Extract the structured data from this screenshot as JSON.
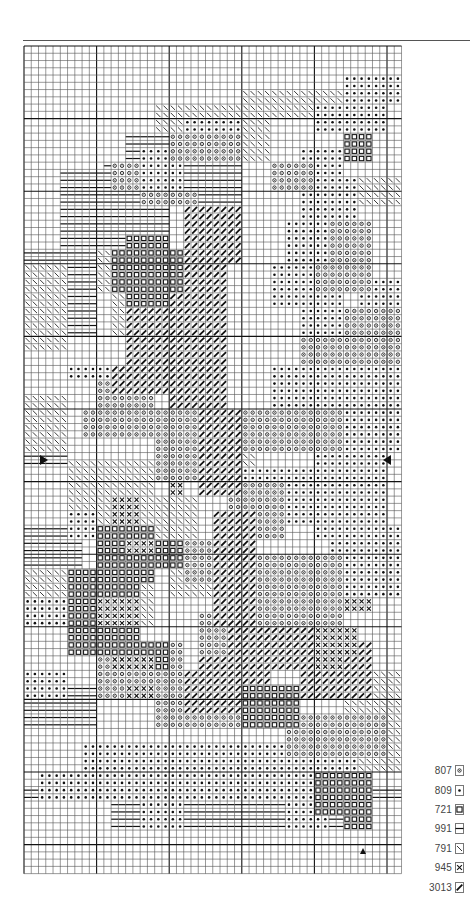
{
  "chart_data": {
    "type": "cross-stitch-pattern",
    "title": "",
    "grid": {
      "columns": 52,
      "rows": 114,
      "cell_px": 7.26,
      "origin_px": [
        24,
        46
      ],
      "bold_line_every": 10,
      "line_color": "#222222",
      "center_markers": {
        "row_arrows": {
          "row": 57,
          "left": "right-pointing-triangle",
          "right": "left-pointing-triangle"
        },
        "column_arrow": {
          "column": 49,
          "position": "bottom",
          "glyph": "up-pointing-triangle"
        }
      }
    },
    "legend": [
      {
        "code": "807",
        "symbol": "circle-dot",
        "glyph": "o"
      },
      {
        "code": "809",
        "symbol": "filled-dot",
        "glyph": "•"
      },
      {
        "code": "721",
        "symbol": "square",
        "glyph": "□"
      },
      {
        "code": "991",
        "symbol": "horizontal-lines",
        "glyph": "═"
      },
      {
        "code": "791",
        "symbol": "backslash",
        "glyph": "\\"
      },
      {
        "code": "945",
        "symbol": "x-cross",
        "glyph": "×"
      },
      {
        "code": "3013",
        "symbol": "bold-slash",
        "glyph": "/"
      }
    ],
    "regions": [
      {
        "symbol": "991",
        "rects": [
          [
            14,
            12,
            34,
            16
          ],
          [
            11,
            16,
            30,
            22
          ],
          [
            5,
            22,
            20,
            28
          ],
          [
            5,
            17,
            14,
            22
          ],
          [
            0,
            28,
            10,
            40
          ],
          [
            0,
            52,
            6,
            58
          ],
          [
            13,
            30,
            20,
            40
          ],
          [
            0,
            66,
            8,
            80
          ],
          [
            0,
            88,
            10,
            94
          ],
          [
            0,
            102,
            52,
            104
          ],
          [
            12,
            104,
            48,
            108
          ]
        ]
      },
      {
        "symbol": "791",
        "rects": [
          [
            0,
            30,
            6,
            42
          ],
          [
            10,
            28,
            18,
            34
          ],
          [
            12,
            34,
            18,
            40
          ],
          [
            0,
            48,
            6,
            56
          ],
          [
            6,
            57,
            22,
            60
          ],
          [
            8,
            60,
            18,
            66
          ],
          [
            6,
            60,
            10,
            66
          ],
          [
            0,
            72,
            6,
            76
          ],
          [
            16,
            62,
            24,
            70
          ],
          [
            20,
            70,
            28,
            76
          ],
          [
            14,
            68,
            18,
            80
          ],
          [
            26,
            50,
            32,
            60
          ],
          [
            18,
            8,
            34,
            12
          ],
          [
            24,
            12,
            34,
            16
          ],
          [
            30,
            6,
            48,
            10
          ],
          [
            46,
            18,
            52,
            22
          ],
          [
            44,
            86,
            52,
            100
          ],
          [
            10,
            66,
            14,
            72
          ]
        ]
      },
      {
        "symbol": "809",
        "rects": [
          [
            44,
            4,
            52,
            8
          ],
          [
            40,
            8,
            50,
            12
          ],
          [
            22,
            10,
            30,
            14
          ],
          [
            16,
            14,
            22,
            20
          ],
          [
            38,
            14,
            44,
            18
          ],
          [
            38,
            18,
            46,
            24
          ],
          [
            36,
            24,
            44,
            30
          ],
          [
            34,
            30,
            44,
            36
          ],
          [
            38,
            36,
            52,
            42
          ],
          [
            34,
            44,
            52,
            50
          ],
          [
            32,
            50,
            52,
            56
          ],
          [
            40,
            56,
            50,
            68
          ],
          [
            28,
            58,
            40,
            66
          ],
          [
            42,
            66,
            52,
            76
          ],
          [
            6,
            64,
            10,
            68
          ],
          [
            0,
            76,
            10,
            80
          ],
          [
            0,
            86,
            6,
            90
          ],
          [
            36,
            70,
            44,
            76
          ],
          [
            30,
            78,
            40,
            82
          ],
          [
            8,
            96,
            46,
            100
          ],
          [
            2,
            100,
            40,
            104
          ],
          [
            16,
            104,
            22,
            108
          ],
          [
            36,
            104,
            42,
            108
          ],
          [
            46,
            32,
            52,
            42
          ],
          [
            6,
            44,
            18,
            46
          ]
        ]
      },
      {
        "symbol": "807",
        "rects": [
          [
            20,
            12,
            30,
            16
          ],
          [
            12,
            16,
            16,
            20
          ],
          [
            16,
            20,
            24,
            22
          ],
          [
            34,
            16,
            40,
            20
          ],
          [
            40,
            30,
            48,
            34
          ],
          [
            44,
            36,
            52,
            40
          ],
          [
            38,
            40,
            52,
            44
          ],
          [
            10,
            46,
            18,
            50
          ],
          [
            8,
            50,
            26,
            54
          ],
          [
            18,
            54,
            24,
            60
          ],
          [
            28,
            60,
            36,
            68
          ],
          [
            22,
            68,
            30,
            74
          ],
          [
            30,
            70,
            44,
            80
          ],
          [
            10,
            82,
            22,
            90
          ],
          [
            18,
            88,
            34,
            94
          ],
          [
            24,
            78,
            30,
            84
          ],
          [
            36,
            92,
            50,
            98
          ],
          [
            30,
            50,
            44,
            56
          ],
          [
            42,
            24,
            48,
            30
          ]
        ]
      },
      {
        "symbol": "3013",
        "rects": [
          [
            22,
            22,
            30,
            30
          ],
          [
            20,
            30,
            28,
            50
          ],
          [
            24,
            50,
            30,
            62
          ],
          [
            26,
            64,
            32,
            80
          ],
          [
            28,
            80,
            44,
            86
          ],
          [
            24,
            84,
            34,
            92
          ],
          [
            38,
            82,
            48,
            90
          ],
          [
            14,
            28,
            22,
            44
          ],
          [
            12,
            44,
            20,
            48
          ],
          [
            22,
            86,
            28,
            92
          ]
        ]
      },
      {
        "symbol": "721",
        "rects": [
          [
            14,
            26,
            20,
            28
          ],
          [
            12,
            28,
            22,
            34
          ],
          [
            14,
            34,
            20,
            36
          ],
          [
            44,
            12,
            48,
            16
          ],
          [
            10,
            66,
            18,
            74
          ],
          [
            6,
            72,
            16,
            84
          ],
          [
            14,
            82,
            20,
            86
          ],
          [
            30,
            88,
            38,
            94
          ],
          [
            40,
            100,
            48,
            106
          ],
          [
            44,
            104,
            48,
            108
          ],
          [
            18,
            68,
            22,
            72
          ]
        ]
      },
      {
        "symbol": "945",
        "rects": [
          [
            12,
            62,
            16,
            66
          ],
          [
            14,
            68,
            18,
            70
          ],
          [
            10,
            76,
            16,
            80
          ],
          [
            12,
            84,
            18,
            86
          ],
          [
            40,
            80,
            46,
            84
          ],
          [
            44,
            76,
            48,
            78
          ],
          [
            20,
            60,
            22,
            62
          ],
          [
            14,
            88,
            18,
            90
          ],
          [
            40,
            84,
            44,
            86
          ]
        ]
      }
    ]
  }
}
